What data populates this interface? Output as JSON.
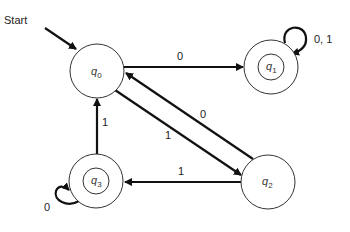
{
  "diagram": {
    "type": "dfa",
    "start_label": "Start",
    "states": [
      {
        "id": "q0",
        "name": "q",
        "sub": "0",
        "accepting": false,
        "start": true
      },
      {
        "id": "q1",
        "name": "q",
        "sub": "1",
        "accepting": true,
        "start": false
      },
      {
        "id": "q2",
        "name": "q",
        "sub": "2",
        "accepting": false,
        "start": false
      },
      {
        "id": "q3",
        "name": "q",
        "sub": "3",
        "accepting": true,
        "start": false
      }
    ],
    "transitions": [
      {
        "from": "q0",
        "to": "q1",
        "label": "0"
      },
      {
        "from": "q1",
        "to": "q1",
        "label": "0, 1"
      },
      {
        "from": "q0",
        "to": "q2",
        "label": "1"
      },
      {
        "from": "q2",
        "to": "q0",
        "label": "0"
      },
      {
        "from": "q2",
        "to": "q3",
        "label": "1"
      },
      {
        "from": "q3",
        "to": "q0",
        "label": "1"
      },
      {
        "from": "q3",
        "to": "q3",
        "label": "0"
      }
    ]
  }
}
